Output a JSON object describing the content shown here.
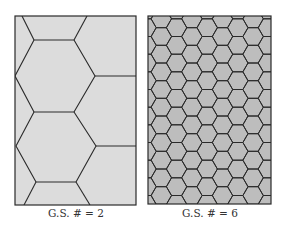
{
  "figure": {
    "panels": [
      {
        "id": "coarse",
        "label": "G.S. # = 2",
        "grain_size_number": 2,
        "fill_color": "#dcdcdc",
        "line_color": "#2a2a2a",
        "box": {
          "x": 15,
          "y": 16,
          "w": 121,
          "h": 189
        }
      },
      {
        "id": "fine",
        "label": "G.S. # = 6",
        "grain_size_number": 6,
        "fill_color": "#bdbdbd",
        "line_color": "#2a2a2a",
        "box": {
          "x": 148,
          "y": 16,
          "w": 123,
          "h": 188
        }
      }
    ]
  }
}
